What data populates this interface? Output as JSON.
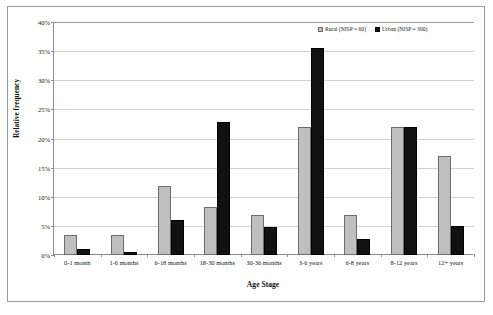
{
  "chart_data": {
    "type": "bar",
    "title": "",
    "xlabel": "Age Stage",
    "ylabel": "Relative frequency",
    "ylim": [
      0,
      40
    ],
    "ytick_labels": [
      "0%",
      "5%",
      "10%",
      "15%",
      "20%",
      "25%",
      "30%",
      "35%",
      "40%"
    ],
    "ytick_values": [
      0,
      5,
      10,
      15,
      20,
      25,
      30,
      35,
      40
    ],
    "grid": true,
    "legend_position": "top-right",
    "categories": [
      "0-1 month",
      "1-6 months",
      "6-18 months",
      "18-30 months",
      "30-36 months",
      "3-6 years",
      "6-8 years",
      "8-12 years",
      "12+ years"
    ],
    "series": [
      {
        "name": "Rural (NISP = 60)",
        "color": "#BFBFBF",
        "values": [
          3.5,
          3.5,
          11.8,
          8.2,
          6.8,
          22.0,
          6.8,
          22.0,
          17.0
        ]
      },
      {
        "name": "Urban (NISP = 300)",
        "color": "#111111",
        "values": [
          1.0,
          0.5,
          6.0,
          22.8,
          4.8,
          35.5,
          2.8,
          22.0,
          5.0
        ]
      }
    ]
  },
  "legend": {
    "entries": [
      {
        "label": "Rural (NISP = 60)"
      },
      {
        "label": "Urban (NISP = 300)"
      }
    ]
  }
}
